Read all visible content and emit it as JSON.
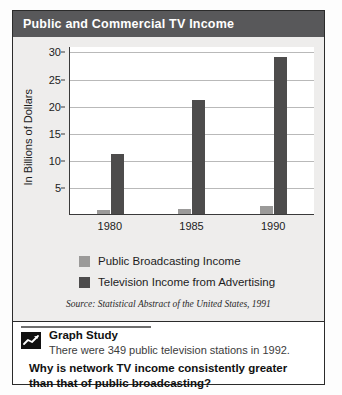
{
  "title": "Public and Commercial TV Income",
  "chart_data": {
    "type": "bar",
    "title": "Public and Commercial TV Income",
    "xlabel": "",
    "ylabel": "In Billions of Dollars",
    "categories": [
      "1980",
      "1985",
      "1990"
    ],
    "series": [
      {
        "name": "Public Broadcasting Income",
        "values": [
          0.7,
          1.0,
          1.4
        ],
        "color": "#9b9a99"
      },
      {
        "name": "Television Income from Advertising",
        "values": [
          11,
          21,
          29
        ],
        "color": "#4d4c4c"
      }
    ],
    "yticks": [
      5,
      10,
      15,
      20,
      25,
      30
    ],
    "ylim": [
      0,
      31
    ],
    "grid": true,
    "legend_position": "bottom",
    "source": "Source: Statistical Abstract of the United States, 1991"
  },
  "legend": [
    {
      "label": "Public Broadcasting Income"
    },
    {
      "label": "Television Income from Advertising"
    }
  ],
  "source": "Source: Statistical Abstract of the United States, 1991",
  "study": {
    "icon": "line-chart-icon",
    "heading": "Graph Study",
    "fact": "There were 349 public television stations in 1992.",
    "question": "Why is network TV income consistently greater than that of public broadcasting?"
  },
  "colors": {
    "title_bar": "#58585a",
    "panel": "#eeedec",
    "series_public": "#9b9a99",
    "series_advertising": "#4d4c4c",
    "frame_border": "#2b2b2b"
  }
}
